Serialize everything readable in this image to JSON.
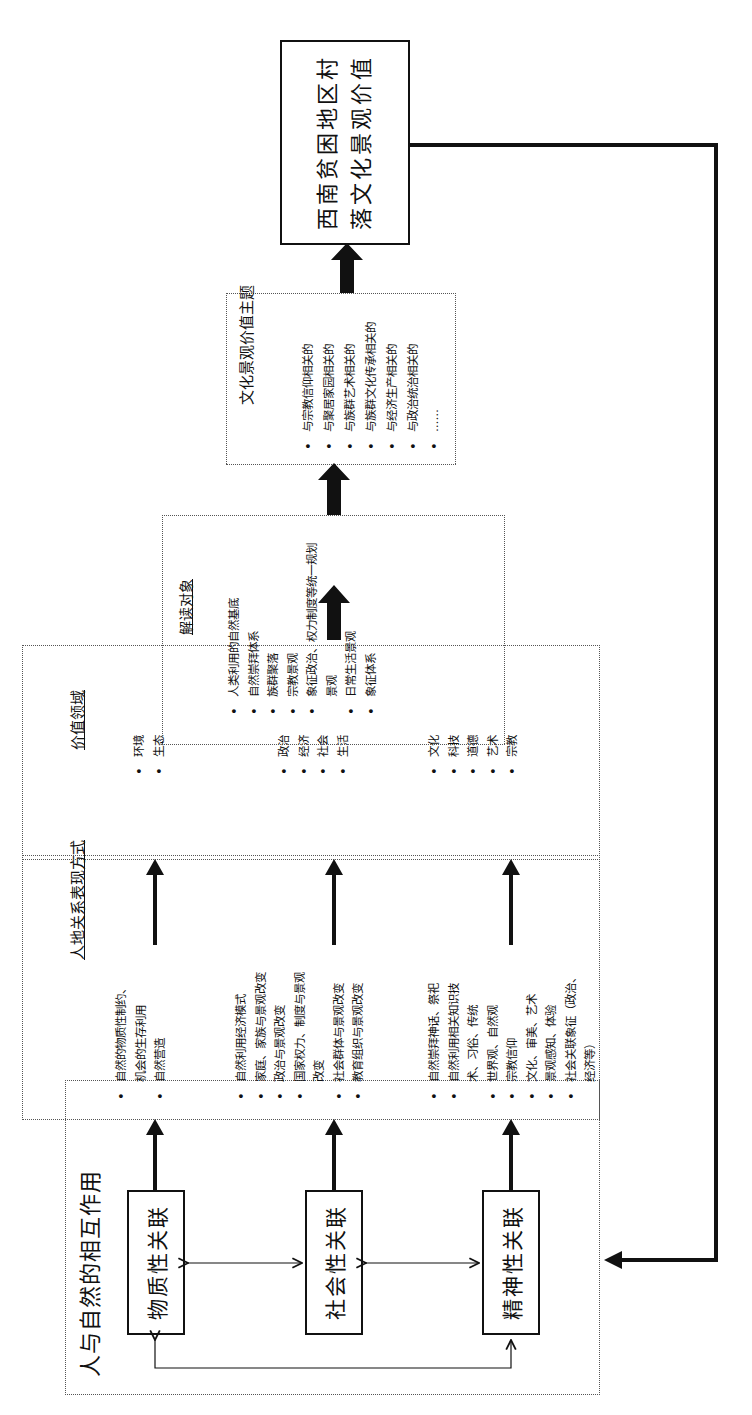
{
  "diagram": {
    "orientation": "rotated 90 degrees counter-clockwise",
    "interaction_group": {
      "title": "人与自然的相互作用",
      "nodes": [
        {
          "label": "物质性关联"
        },
        {
          "label": "社会性关联"
        },
        {
          "label": "精神性关联"
        }
      ]
    },
    "expression_box": {
      "heading": "人地关系表现方式",
      "groups": [
        {
          "items": [
            "自然的物质性制约、",
            "机会的生存利用",
            "自然营造"
          ],
          "bullets": [
            true,
            false,
            true
          ]
        },
        {
          "items": [
            "自然利用经济模式",
            "家庭、家族与景观改变",
            "政治与景观改变",
            "国家权力、制度与景观",
            "改变",
            "社会群体与景观改变",
            "教育组织与景观改变"
          ],
          "bullets": [
            true,
            true,
            true,
            true,
            false,
            true,
            true
          ]
        },
        {
          "items": [
            "自然崇拜神话、祭祀",
            "自然利用相关知识技",
            "术、习俗、传统",
            "世界观、自然观",
            "宗教信仰",
            "文化、审美、艺术",
            "景观感知、体验",
            "社会关联象征（政治、",
            "经济等）"
          ],
          "bullets": [
            true,
            true,
            false,
            true,
            true,
            true,
            true,
            true,
            false
          ]
        }
      ]
    },
    "value_domain_box": {
      "heading": "价值领域",
      "groups": [
        {
          "items": [
            "环境",
            "生态"
          ]
        },
        {
          "items": [
            "政治",
            "经济",
            "社会",
            "生活"
          ]
        },
        {
          "items": [
            "文化",
            "科技",
            "道德",
            "艺术",
            "宗教"
          ]
        }
      ]
    },
    "interpretation_box": {
      "heading": "解读对象",
      "items": [
        "人类利用的自然基底",
        "自然崇拜体系",
        "族群聚落",
        "宗教景观",
        "象征政治、权力制度等统一规划",
        "景观",
        "日常生活景观",
        "象征体系"
      ],
      "bullets": [
        true,
        true,
        true,
        true,
        true,
        false,
        true,
        true
      ]
    },
    "theme_box": {
      "heading": "文化景观价值主题",
      "items": [
        "与宗教信仰相关的",
        "与聚居家园相关的",
        "与族群艺术相关的",
        "与族群文化传承相关的",
        "与经济生产相关的",
        "与政治统治相关的",
        "……"
      ]
    },
    "final_node": {
      "label_line1": "西南贫困地区村",
      "label_line2": "落文化景观价值"
    },
    "colors": {
      "line": "#111111",
      "dotted_border": "#555555",
      "background": "#ffffff"
    }
  }
}
